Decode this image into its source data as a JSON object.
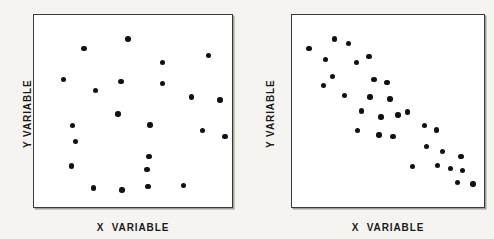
{
  "figure": {
    "background_color": "#f6f4f1",
    "panel_background_color": "#ffffff",
    "border_color": "#3a3a3a",
    "dot_color": "#111111"
  },
  "chart_data": [
    {
      "type": "scatter",
      "title": "",
      "xlabel": "X  VARIABLE",
      "ylabel": "Y VARIABLE",
      "xlim": [
        0,
        100
      ],
      "ylim": [
        0,
        100
      ],
      "grid": false,
      "legend": "none",
      "relationship": "no correlation",
      "n_points": 23,
      "points": [
        {
          "x": 25.2,
          "y": 82.5
        },
        {
          "x": 47.5,
          "y": 87.6
        },
        {
          "x": 65.0,
          "y": 75.3
        },
        {
          "x": 88.0,
          "y": 78.9
        },
        {
          "x": 15.0,
          "y": 66.5
        },
        {
          "x": 44.0,
          "y": 65.5
        },
        {
          "x": 31.0,
          "y": 60.8
        },
        {
          "x": 65.0,
          "y": 64.4
        },
        {
          "x": 79.5,
          "y": 57.2
        },
        {
          "x": 94.0,
          "y": 55.7
        },
        {
          "x": 42.5,
          "y": 48.5
        },
        {
          "x": 19.5,
          "y": 42.3
        },
        {
          "x": 58.5,
          "y": 42.8
        },
        {
          "x": 85.0,
          "y": 39.7
        },
        {
          "x": 96.5,
          "y": 36.6
        },
        {
          "x": 21.0,
          "y": 34.0
        },
        {
          "x": 58.0,
          "y": 26.3
        },
        {
          "x": 57.0,
          "y": 19.6
        },
        {
          "x": 19.0,
          "y": 21.4
        },
        {
          "x": 57.5,
          "y": 10.8
        },
        {
          "x": 30.0,
          "y": 9.8
        },
        {
          "x": 44.5,
          "y": 8.8
        },
        {
          "x": 75.5,
          "y": 11.3
        }
      ]
    },
    {
      "type": "scatter",
      "title": "",
      "xlabel": "X  VARIABLE",
      "ylabel": "Y VARIABLE",
      "xlim": [
        0,
        100
      ],
      "ylim": [
        0,
        100
      ],
      "grid": false,
      "legend": "none",
      "relationship": "negative correlation",
      "n_points": 31,
      "points": [
        {
          "x": 8.8,
          "y": 82.5
        },
        {
          "x": 22.2,
          "y": 87.6
        },
        {
          "x": 29.4,
          "y": 85.1
        },
        {
          "x": 17.5,
          "y": 76.8
        },
        {
          "x": 33.5,
          "y": 75.3
        },
        {
          "x": 40.2,
          "y": 78.4
        },
        {
          "x": 21.1,
          "y": 68.0
        },
        {
          "x": 42.8,
          "y": 66.5
        },
        {
          "x": 49.5,
          "y": 64.9
        },
        {
          "x": 27.3,
          "y": 58.2
        },
        {
          "x": 40.7,
          "y": 57.2
        },
        {
          "x": 51.0,
          "y": 56.2
        },
        {
          "x": 60.3,
          "y": 49.5
        },
        {
          "x": 46.4,
          "y": 46.9
        },
        {
          "x": 34.0,
          "y": 39.7
        },
        {
          "x": 45.4,
          "y": 37.6
        },
        {
          "x": 52.6,
          "y": 36.6
        },
        {
          "x": 69.1,
          "y": 42.3
        },
        {
          "x": 75.3,
          "y": 40.2
        },
        {
          "x": 70.1,
          "y": 31.4
        },
        {
          "x": 78.4,
          "y": 28.9
        },
        {
          "x": 88.1,
          "y": 26.3
        },
        {
          "x": 62.9,
          "y": 21.1
        },
        {
          "x": 75.8,
          "y": 21.6
        },
        {
          "x": 82.5,
          "y": 20.1
        },
        {
          "x": 88.7,
          "y": 19.1
        },
        {
          "x": 86.1,
          "y": 12.9
        },
        {
          "x": 94.3,
          "y": 11.9
        },
        {
          "x": 55.2,
          "y": 47.9
        },
        {
          "x": 36.1,
          "y": 50.0
        },
        {
          "x": 16.5,
          "y": 63.4
        }
      ]
    }
  ],
  "panels": [
    {
      "name": "left-scatter-panel",
      "x_axis_label": "X  VARIABLE",
      "y_axis_label": "Y VARIABLE"
    },
    {
      "name": "right-scatter-panel",
      "x_axis_label": "X  VARIABLE",
      "y_axis_label": "Y VARIABLE"
    }
  ]
}
